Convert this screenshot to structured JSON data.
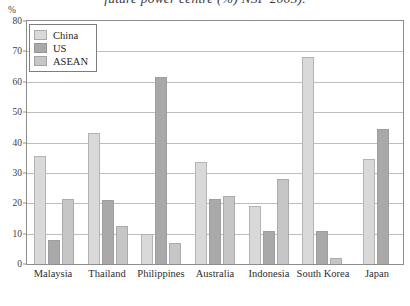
{
  "chart_data": {
    "type": "bar",
    "title": "future power centre (%) NSF 2005).",
    "xlabel": "",
    "ylabel": "%",
    "ylim": [
      0,
      80
    ],
    "ytick_step": 10,
    "yticks": [
      0,
      10,
      20,
      30,
      40,
      50,
      60,
      70,
      80
    ],
    "grid": true,
    "legend_position": "top-left",
    "categories": [
      "Malaysia",
      "Thailand",
      "Philippines",
      "Australia",
      "Indonesia",
      "South Korea",
      "Japan"
    ],
    "series": [
      {
        "name": "China",
        "color": "#d9d9d9",
        "values": [
          35.5,
          43,
          10,
          33.5,
          19,
          68,
          34.5
        ]
      },
      {
        "name": "US",
        "color": "#a9a9a9",
        "values": [
          8,
          21,
          61.5,
          21.5,
          11,
          11,
          44.5
        ]
      },
      {
        "name": "ASEAN",
        "color": "#c6c6c6",
        "values": [
          21.5,
          12.5,
          7,
          22.5,
          28,
          2,
          0
        ]
      }
    ]
  },
  "axis": {
    "percent_symbol": "%"
  }
}
